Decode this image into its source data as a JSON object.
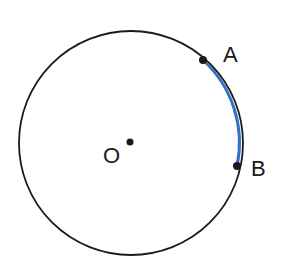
{
  "diagram": {
    "type": "circle-arc",
    "center": {
      "label": "O",
      "x": 130,
      "y": 142
    },
    "radius": 112,
    "points": [
      {
        "label": "A",
        "x": 203,
        "y": 60
      },
      {
        "label": "B",
        "x": 237,
        "y": 166
      }
    ],
    "arc": {
      "from": "A",
      "to": "B",
      "color": "#3a6fc4"
    },
    "circle_color": "#1a1a1a"
  }
}
